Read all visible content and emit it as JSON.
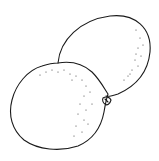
{
  "illustration": {
    "subject": "Two citrus fruits line drawing",
    "stroke_color": "#1a1a1a",
    "background_color": "#ffffff",
    "fruits": [
      {
        "name": "back-fruit",
        "position": "upper-right"
      },
      {
        "name": "front-fruit",
        "position": "lower-left"
      }
    ]
  }
}
